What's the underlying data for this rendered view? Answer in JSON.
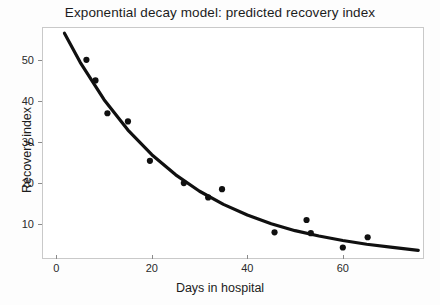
{
  "chart_data": {
    "type": "scatter",
    "title": "Exponential decay model: predicted recovery index",
    "xlabel": "Days in hospital",
    "ylabel": "Recovery index",
    "xlim": [
      -3,
      77
    ],
    "ylim": [
      1.5,
      58
    ],
    "grid": false,
    "legend": null,
    "x_ticks": [
      0,
      20,
      40,
      60
    ],
    "x_tick_labels": [
      "0",
      "20",
      "40",
      "60"
    ],
    "y_ticks": [
      10,
      20,
      30,
      40,
      50
    ],
    "y_tick_labels": [
      "10",
      "20",
      "30",
      "40",
      "50"
    ],
    "series": [
      {
        "name": "observed recovery index",
        "type": "scatter",
        "marker": "filled-circle",
        "color": "#101010",
        "x": [
          6.3,
          8.2,
          10.7,
          15.0,
          19.6,
          26.7,
          31.8,
          34.7,
          45.7,
          52.4,
          53.3,
          60.0,
          65.2
        ],
        "y": [
          50.0,
          45.0,
          37.0,
          35.0,
          25.4,
          20.0,
          16.5,
          18.5,
          8.0,
          11.0,
          7.8,
          4.3,
          6.8
        ]
      },
      {
        "name": "fitted exponential decay curve",
        "type": "line",
        "color": "#101010",
        "x": [
          1.7,
          5,
          10,
          15,
          20,
          25,
          30,
          35,
          40,
          45,
          50,
          55,
          60,
          65,
          70,
          75.8
        ],
        "y": [
          56.5,
          49.4,
          40.3,
          32.9,
          26.9,
          22.0,
          18.0,
          14.8,
          12.2,
          10.1,
          8.4,
          7.1,
          6.0,
          5.1,
          4.4,
          3.6
        ]
      }
    ]
  },
  "style": {
    "background": "#fdfdfd",
    "plot_background": "#ffffff",
    "frame_color": "#c9c9c9",
    "ink": "#101010",
    "text_color": "#1c1c1c"
  }
}
